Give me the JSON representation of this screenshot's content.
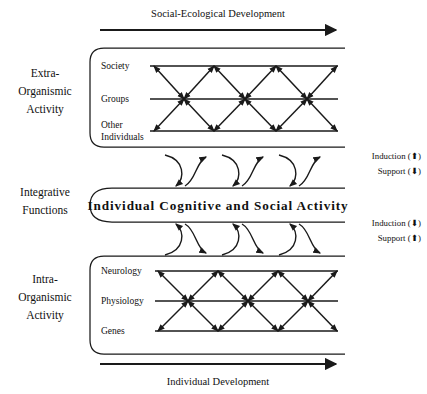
{
  "figure": {
    "title_top": "Social-Ecological Development",
    "title_bottom": "Individual Development",
    "center_band_label": "Individual Cognitive and Social Activity",
    "tiers": [
      {
        "id": "extra-organismic",
        "label_lines": [
          "Extra-",
          "Organismic",
          "Activity"
        ],
        "rows": [
          {
            "id": "society",
            "label_lines": [
              "Society"
            ]
          },
          {
            "id": "groups",
            "label_lines": [
              "Groups"
            ]
          },
          {
            "id": "other-individuals",
            "label_lines": [
              "Other",
              "Individuals"
            ]
          }
        ]
      },
      {
        "id": "integrative-functions",
        "label_lines": [
          "Integrative",
          "Functions"
        ],
        "rows": []
      },
      {
        "id": "intra-organismic",
        "label_lines": [
          "Intra-",
          "Organismic",
          "Activity"
        ],
        "rows": [
          {
            "id": "neurology",
            "label_lines": [
              "Neurology"
            ]
          },
          {
            "id": "physiology",
            "label_lines": [
              "Physiology"
            ]
          },
          {
            "id": "genes",
            "label_lines": [
              "Genes"
            ]
          }
        ]
      }
    ],
    "legends": [
      {
        "id": "upper-legend",
        "entries": [
          {
            "id": "induction-up",
            "text": "Induction (⬆)",
            "name": "Induction",
            "glyph": "up-arrow"
          },
          {
            "id": "support-down",
            "text": "Support (⬇)",
            "name": "Support",
            "glyph": "down-arrow"
          }
        ]
      },
      {
        "id": "lower-legend",
        "entries": [
          {
            "id": "induction-down",
            "text": "Induction (⬇)",
            "name": "Induction",
            "glyph": "down-arrow"
          },
          {
            "id": "support-up",
            "text": "Support (⬆)",
            "name": "Support",
            "glyph": "up-arrow"
          }
        ]
      }
    ],
    "colors": {
      "ink": "#1a1a1a",
      "text": "#111111",
      "background": "#ffffff"
    }
  }
}
